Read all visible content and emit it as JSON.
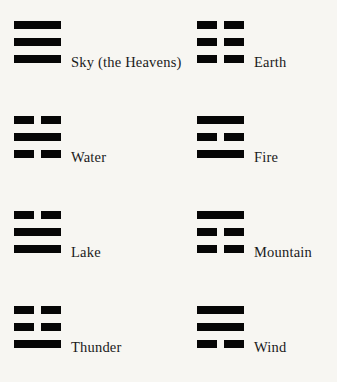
{
  "page": {
    "background_color": "#f7f6f2",
    "line_color": "#060606",
    "text_color": "#1a1a1a"
  },
  "legend": {
    "solid_line_name": "yang-solid-line",
    "broken_line_name": "yin-broken-line"
  },
  "trigrams": [
    {
      "label": "Sky (the Heavens)",
      "lines": [
        "solid",
        "solid",
        "solid"
      ],
      "column": "left",
      "row": 1,
      "x": 14,
      "y": 21
    },
    {
      "label": "Earth",
      "lines": [
        "broken",
        "broken",
        "broken"
      ],
      "column": "right",
      "row": 1,
      "x": 197,
      "y": 21
    },
    {
      "label": "Water",
      "lines": [
        "broken",
        "solid",
        "broken"
      ],
      "column": "left",
      "row": 2,
      "x": 14,
      "y": 116
    },
    {
      "label": "Fire",
      "lines": [
        "solid",
        "broken",
        "solid"
      ],
      "column": "right",
      "row": 2,
      "x": 197,
      "y": 116
    },
    {
      "label": "Lake",
      "lines": [
        "broken",
        "solid",
        "solid"
      ],
      "column": "left",
      "row": 3,
      "x": 14,
      "y": 211
    },
    {
      "label": "Mountain",
      "lines": [
        "solid",
        "broken",
        "broken"
      ],
      "column": "right",
      "row": 3,
      "x": 197,
      "y": 211
    },
    {
      "label": "Thunder",
      "lines": [
        "broken",
        "broken",
        "solid"
      ],
      "column": "left",
      "row": 4,
      "x": 14,
      "y": 306
    },
    {
      "label": "Wind",
      "lines": [
        "solid",
        "solid",
        "broken"
      ],
      "column": "right",
      "row": 4,
      "x": 197,
      "y": 306
    }
  ]
}
